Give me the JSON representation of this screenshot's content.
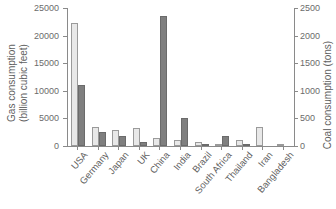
{
  "chart_data": {
    "type": "bar",
    "title": "",
    "categories": [
      "USA",
      "Germany",
      "Japan",
      "UK",
      "China",
      "India",
      "Brazil",
      "South Africa",
      "Thailand",
      "Iran",
      "Bangladesh"
    ],
    "series": [
      {
        "name": "Gas consumption",
        "axis": "left",
        "fill": "#e8e8e8",
        "border": "#9a9a9a",
        "values": [
          22200,
          3450,
          2950,
          3350,
          1500,
          1100,
          650,
          120,
          1000,
          3400,
          420
        ]
      },
      {
        "name": "Coal consumption",
        "axis": "right",
        "fill": "#7f7f7f",
        "border": "#6b6b6b",
        "values": [
          1100,
          260,
          180,
          70,
          2350,
          510,
          25,
          175,
          35,
          0,
          0
        ]
      }
    ],
    "left_axis": {
      "label_line1": "Gas consumption",
      "label_line2": "(billion cubic feet)",
      "min": 0,
      "max": 25000,
      "step": 5000,
      "tick_labels": [
        "0",
        "5000",
        "10000",
        "15000",
        "20000",
        "25000"
      ]
    },
    "right_axis": {
      "label": "Coal consumption (tons)",
      "min": 0,
      "max": 2500,
      "step": 500,
      "tick_labels": [
        "0",
        "500",
        "1000",
        "1500",
        "2000",
        "2500"
      ]
    },
    "grid": false,
    "legend_position": "none"
  },
  "colors": {
    "background": "#ffffff",
    "axis_line": "#8a8a8a",
    "text": "#5f5f5f",
    "light_bar": "#e8e8e8",
    "dark_bar": "#7f7f7f"
  }
}
